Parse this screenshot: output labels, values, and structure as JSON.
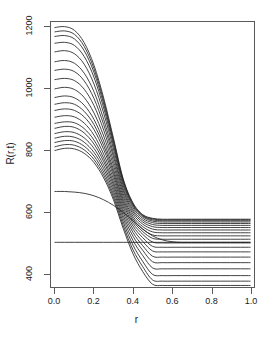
{
  "chart_data": {
    "type": "line",
    "title": "",
    "xlabel": "r",
    "ylabel": "R(r,t)",
    "xlim": [
      -0.02,
      1.02
    ],
    "ylim": [
      355,
      1215
    ],
    "grid": false,
    "legend": "none",
    "xticks": [
      "0.0",
      "0.2",
      "0.4",
      "0.6",
      "0.8",
      "1.0"
    ],
    "xtick_values": [
      0.0,
      0.2,
      0.4,
      0.6,
      0.8,
      1.0
    ],
    "yticks": [
      "400",
      "600",
      "800",
      "1000",
      "1200"
    ],
    "ytick_values": [
      400,
      600,
      800,
      1000,
      1200
    ],
    "x": [
      0.0,
      0.05,
      0.1,
      0.15,
      0.2,
      0.25,
      0.3,
      0.35,
      0.4,
      0.45,
      0.5,
      0.55,
      0.6,
      0.65,
      0.7,
      0.75,
      0.8,
      0.85,
      0.9,
      0.95,
      1.0
    ],
    "series": [
      {
        "name": "t01",
        "peak": 1200,
        "plateau": 575,
        "values": [
          1197,
          1200,
          1188,
          1148,
          1075,
          968,
          838,
          706,
          628,
          590,
          578,
          575,
          575,
          575,
          575,
          575,
          575,
          575,
          575,
          575,
          575
        ]
      },
      {
        "name": "t02",
        "peak": 1185,
        "plateau": 573,
        "values": [
          1183,
          1186,
          1175,
          1136,
          1064,
          959,
          831,
          702,
          625,
          588,
          576,
          573,
          573,
          573,
          573,
          573,
          573,
          573,
          573,
          573,
          573
        ]
      },
      {
        "name": "t03",
        "peak": 1170,
        "plateau": 570,
        "values": [
          1168,
          1171,
          1160,
          1122,
          1052,
          949,
          824,
          698,
          622,
          586,
          573,
          570,
          570,
          570,
          570,
          570,
          570,
          570,
          570,
          570,
          570
        ]
      },
      {
        "name": "t04",
        "peak": 1148,
        "plateau": 566,
        "values": [
          1146,
          1149,
          1139,
          1103,
          1036,
          936,
          815,
          692,
          618,
          583,
          569,
          566,
          566,
          566,
          566,
          566,
          566,
          566,
          566,
          566,
          566
        ]
      },
      {
        "name": "t05",
        "peak": 1120,
        "plateau": 561,
        "values": [
          1118,
          1122,
          1112,
          1078,
          1014,
          919,
          803,
          684,
          612,
          578,
          564,
          561,
          561,
          561,
          561,
          561,
          561,
          561,
          561,
          561,
          561
        ]
      },
      {
        "name": "t06",
        "peak": 1088,
        "plateau": 555,
        "values": [
          1086,
          1090,
          1081,
          1049,
          989,
          899,
          789,
          675,
          605,
          572,
          558,
          555,
          555,
          555,
          555,
          555,
          555,
          555,
          555,
          555,
          555
        ]
      },
      {
        "name": "t07",
        "peak": 1060,
        "plateau": 548,
        "values": [
          1058,
          1062,
          1054,
          1024,
          967,
          882,
          777,
          667,
          599,
          566,
          551,
          548,
          548,
          548,
          548,
          548,
          548,
          548,
          548,
          548,
          548
        ]
      },
      {
        "name": "t08",
        "peak": 1030,
        "plateau": 540,
        "values": [
          1028,
          1032,
          1025,
          997,
          944,
          864,
          763,
          658,
          592,
          559,
          543,
          540,
          540,
          540,
          540,
          540,
          540,
          540,
          540,
          540,
          540
        ]
      },
      {
        "name": "t09",
        "peak": 1000,
        "plateau": 531,
        "values": [
          998,
          1003,
          996,
          970,
          920,
          845,
          750,
          649,
          584,
          551,
          534,
          531,
          531,
          531,
          531,
          531,
          531,
          531,
          531,
          531,
          531
        ]
      },
      {
        "name": "t10",
        "peak": 972,
        "plateau": 521,
        "values": [
          970,
          975,
          969,
          945,
          899,
          828,
          737,
          640,
          577,
          543,
          524,
          521,
          521,
          521,
          521,
          521,
          521,
          521,
          521,
          521,
          521
        ]
      },
      {
        "name": "t11",
        "peak": 950,
        "plateau": 510,
        "values": [
          948,
          953,
          948,
          925,
          882,
          814,
          727,
          632,
          570,
          535,
          513,
          510,
          510,
          510,
          510,
          510,
          510,
          510,
          510,
          510,
          510
        ]
      },
      {
        "name": "t12",
        "peak": 930,
        "plateau": 498,
        "values": [
          928,
          933,
          928,
          907,
          866,
          801,
          717,
          624,
          562,
          526,
          501,
          498,
          498,
          498,
          498,
          498,
          498,
          498,
          498,
          498,
          498
        ]
      },
      {
        "name": "t13",
        "peak": 908,
        "plateau": 484,
        "values": [
          906,
          911,
          907,
          887,
          848,
          786,
          706,
          615,
          553,
          515,
          487,
          484,
          484,
          484,
          484,
          484,
          484,
          484,
          484,
          484,
          484
        ]
      },
      {
        "name": "t14",
        "peak": 888,
        "plateau": 469,
        "values": [
          886,
          891,
          888,
          869,
          832,
          773,
          695,
          606,
          543,
          503,
          472,
          469,
          469,
          469,
          469,
          469,
          469,
          469,
          469,
          469,
          469
        ]
      },
      {
        "name": "t15",
        "peak": 872,
        "plateau": 452,
        "values": [
          870,
          876,
          873,
          855,
          819,
          762,
          686,
          597,
          532,
          489,
          455,
          452,
          452,
          452,
          452,
          452,
          452,
          452,
          452,
          452,
          452
        ]
      },
      {
        "name": "t16",
        "peak": 855,
        "plateau": 434,
        "values": [
          853,
          859,
          856,
          839,
          805,
          750,
          676,
          587,
          520,
          474,
          437,
          434,
          434,
          434,
          434,
          434,
          434,
          434,
          434,
          434,
          434
        ]
      },
      {
        "name": "t17",
        "peak": 840,
        "plateau": 414,
        "values": [
          838,
          844,
          841,
          825,
          792,
          739,
          666,
          577,
          506,
          457,
          417,
          414,
          414,
          414,
          414,
          414,
          414,
          414,
          414,
          414,
          414
        ]
      },
      {
        "name": "t18",
        "peak": 826,
        "plateau": 392,
        "values": [
          824,
          830,
          828,
          812,
          780,
          728,
          656,
          566,
          491,
          438,
          396,
          392,
          392,
          392,
          392,
          392,
          392,
          392,
          392,
          392,
          392
        ]
      },
      {
        "name": "t19",
        "peak": 812,
        "plateau": 374,
        "values": [
          810,
          817,
          815,
          800,
          769,
          718,
          647,
          555,
          476,
          421,
          378,
          374,
          374,
          374,
          374,
          374,
          374,
          374,
          374,
          374,
          374
        ]
      },
      {
        "name": "t20",
        "peak": 800,
        "plateau": 360,
        "values": [
          798,
          805,
          803,
          789,
          759,
          709,
          638,
          545,
          463,
          405,
          364,
          360,
          360,
          360,
          360,
          360,
          360,
          360,
          360,
          360,
          360
        ]
      },
      {
        "name": "t-early",
        "peak": 665,
        "plateau": 500,
        "values": [
          665,
          665,
          663,
          659,
          651,
          638,
          620,
          597,
          570,
          543,
          521,
          508,
          502,
          500,
          500,
          500,
          500,
          500,
          500,
          500,
          500
        ]
      },
      {
        "name": "t-steady",
        "peak": 500,
        "plateau": 500,
        "values": [
          500,
          500,
          500,
          500,
          500,
          500,
          500,
          500,
          500,
          500,
          500,
          500,
          500,
          500,
          500,
          500,
          500,
          500,
          500,
          500,
          500
        ]
      }
    ],
    "line_color": "#222222",
    "axis_color": "#5a5a5a",
    "background": "#ffffff"
  }
}
